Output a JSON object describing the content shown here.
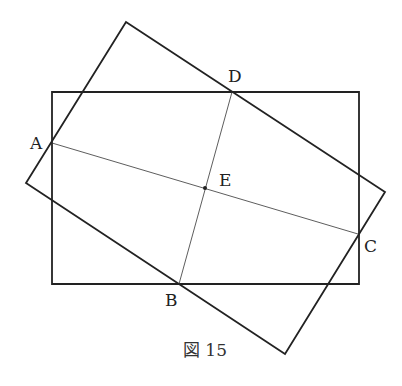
{
  "figure": {
    "caption": "図 15",
    "stroke_color": "#222222",
    "axis_rectangle": {
      "top_left": [
        52,
        92
      ],
      "top_right": [
        359,
        92
      ],
      "bottom_right": [
        359,
        284
      ],
      "bottom_left": [
        52,
        284
      ]
    },
    "tilted_rectangle": {
      "top": [
        126,
        22
      ],
      "right": [
        385,
        192
      ],
      "bottom": [
        285,
        354
      ],
      "left": [
        26,
        183
      ]
    },
    "points": [
      {
        "name": "A",
        "x": 52,
        "y": 143,
        "label_x": 30,
        "label_y": 149
      },
      {
        "name": "B",
        "x": 179,
        "y": 284,
        "label_x": 165,
        "label_y": 306
      },
      {
        "name": "C",
        "x": 358,
        "y": 234,
        "label_x": 364,
        "label_y": 252
      },
      {
        "name": "D",
        "x": 232,
        "y": 92,
        "label_x": 228,
        "label_y": 82
      },
      {
        "name": "E",
        "x": 205,
        "y": 188,
        "label_x": 219,
        "label_y": 186
      }
    ],
    "segments": [
      {
        "from": "A",
        "to": "C"
      },
      {
        "from": "B",
        "to": "D"
      }
    ]
  }
}
